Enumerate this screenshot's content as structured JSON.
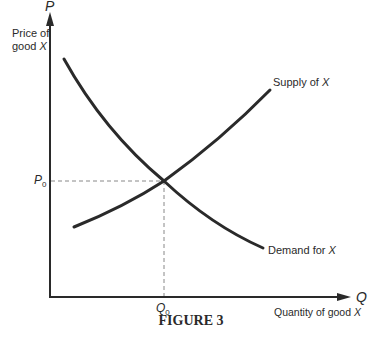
{
  "figure": {
    "caption": "FIGURE 3",
    "y_axis": {
      "symbol": "P",
      "label_line1": "Price of",
      "label_line2": "good ",
      "label_var": "X"
    },
    "x_axis": {
      "symbol": "Q",
      "label": "Quantity of good ",
      "label_var": "X"
    },
    "equilibrium": {
      "price_label": "P",
      "price_sub": "0",
      "quantity_label": "Q",
      "quantity_sub": "0"
    },
    "curves": [
      {
        "name": "Supply",
        "label": "Supply of ",
        "label_var": "X"
      },
      {
        "name": "Demand",
        "label": "Demand for ",
        "label_var": "X"
      }
    ],
    "colors": {
      "line": "#2a2a2a",
      "dashed": "#888888"
    }
  }
}
